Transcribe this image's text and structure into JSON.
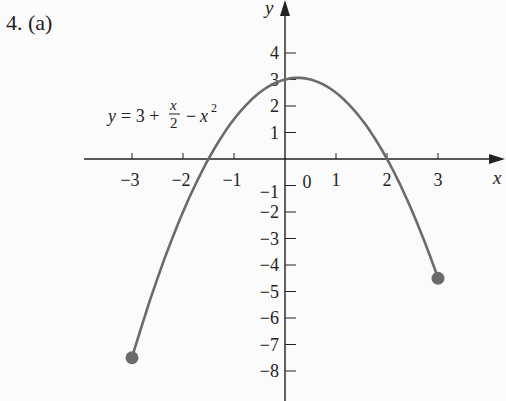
{
  "problem_label": "4. (a)",
  "chart_data": {
    "type": "line",
    "title": "4. (a)",
    "equation_label": "y = 3 + x/2 − x²",
    "function": "y = 3 + x/2 - x^2",
    "domain": [
      -3,
      3
    ],
    "xlabel": "x",
    "ylabel": "y",
    "xlim": [
      -3.5,
      3.9
    ],
    "ylim": [
      -9,
      5
    ],
    "x_ticks": [
      -3,
      -2,
      -1,
      0,
      1,
      2,
      3
    ],
    "x_tick_labels": [
      "−3",
      "−2",
      "−1",
      "0",
      "1",
      "2",
      "3"
    ],
    "y_ticks": [
      4,
      3,
      2,
      1,
      -1,
      -2,
      -3,
      -4,
      -5,
      -6,
      -7,
      -8
    ],
    "y_tick_labels": [
      "4",
      "3",
      "2",
      "1",
      "−1",
      "−2",
      "−3",
      "−4",
      "−5",
      "−6",
      "−7",
      "−8"
    ],
    "endpoints": [
      {
        "x": -3,
        "y": -7.5,
        "closed": true
      },
      {
        "x": 3,
        "y": -4.5,
        "closed": true
      }
    ],
    "vertex": {
      "x": 0.25,
      "y": 3.0625
    },
    "x_intercepts": [
      -1.5,
      2
    ],
    "y_intercept": 3,
    "grid": false,
    "legend": null,
    "curve_color": "#6b6b6b",
    "axis_color": "#222222"
  }
}
